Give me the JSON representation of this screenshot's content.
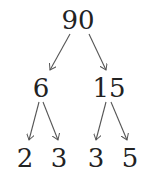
{
  "tree": {
    "root": {
      "value": "90"
    },
    "level1": [
      {
        "value": "6"
      },
      {
        "value": "15"
      }
    ],
    "level2": [
      {
        "value": "2"
      },
      {
        "value": "3"
      },
      {
        "value": "3"
      },
      {
        "value": "5"
      }
    ]
  },
  "colors": {
    "text": "#222222",
    "arrow": "#555555"
  }
}
